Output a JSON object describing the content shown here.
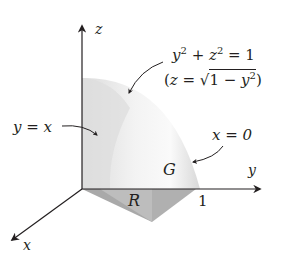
{
  "figure": {
    "type": "3D region diagram",
    "axes": {
      "x_label": "x",
      "y_label": "y",
      "z_label": "z",
      "y_tick": "1"
    },
    "labels": {
      "surface_eq_lhs": "y",
      "surface_eq_mid": " + ",
      "surface_eq_z": "z",
      "surface_eq_rhs": " = 1",
      "surface_exp": "2",
      "surface_solved_open": "(",
      "surface_solved_z": "z",
      "surface_solved_eq": " = √",
      "surface_solved_radicand_1": "1 − ",
      "surface_solved_radicand_y": "y",
      "surface_solved_close": ")",
      "plane_y_eq_x": "y = x",
      "plane_x_eq_0": "x = 0",
      "solid_label": "G",
      "region_label": "R"
    },
    "colors": {
      "ink": "#231f20",
      "face_light": "#e6e6e6",
      "face_mid": "#d2d2d2",
      "base_dark": "#a9a9a9",
      "base_light": "#c9c9c9"
    }
  }
}
